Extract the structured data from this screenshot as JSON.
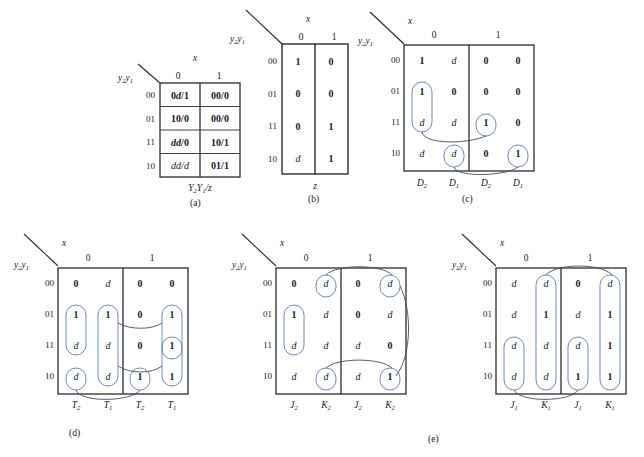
{
  "figure": {
    "captions": [
      "(a)",
      "(b)",
      "(c)",
      "(d)",
      "(e)"
    ]
  },
  "common": {
    "row_header": "y₂y₁",
    "col_var": "x",
    "col_values": [
      "0",
      "1"
    ],
    "row_values": [
      "00",
      "01",
      "11",
      "10"
    ],
    "dont_care": "d"
  },
  "table_a": {
    "caption": "(a)",
    "col_var": "x",
    "row_header": "y₂y₁",
    "col_values": [
      "0",
      "1"
    ],
    "row_values": [
      "00",
      "01",
      "11",
      "10"
    ],
    "bottom_label": "Y₂Y₁/z",
    "cells": [
      [
        "0d/1",
        "00/0"
      ],
      [
        "10/0",
        "00/0"
      ],
      [
        "dd/0",
        "10/1"
      ],
      [
        "dd/d",
        "01/1"
      ]
    ],
    "cell_styles": [
      [
        "mixed",
        "bold"
      ],
      [
        "bold",
        "bold"
      ],
      [
        "italic",
        "bold"
      ],
      [
        "italic",
        "bold"
      ]
    ]
  },
  "table_b": {
    "caption": "(b)",
    "col_var": "x",
    "row_header": "y₂y₁",
    "col_values": [
      "0",
      "1"
    ],
    "row_values": [
      "00",
      "01",
      "11",
      "10"
    ],
    "bottom_label": "z",
    "cells": [
      [
        "1",
        "0"
      ],
      [
        "0",
        "0"
      ],
      [
        "0",
        "1"
      ],
      [
        "d",
        "1"
      ]
    ]
  },
  "table_c": {
    "caption": "(c)",
    "col_var": "x",
    "row_header": "y₂y₁",
    "col_values": [
      "0",
      "1"
    ],
    "row_values": [
      "00",
      "01",
      "11",
      "10"
    ],
    "bottom_labels": [
      "D₂",
      "D₁",
      "D₂",
      "D₁"
    ],
    "cells": [
      [
        "1",
        "d",
        "0",
        "0"
      ],
      [
        "1",
        "0",
        "0",
        "0"
      ],
      [
        "d",
        "d",
        "1",
        "0"
      ],
      [
        "d",
        "d",
        "0",
        "1"
      ]
    ],
    "groups": [
      {
        "col": 0,
        "rows": [
          1,
          2
        ],
        "note": "D2 x=0 rows 01,11"
      },
      {
        "col": 2,
        "rows": [
          2,
          2
        ],
        "note": "D2 x=1 row 11"
      },
      {
        "col": 1,
        "rows": [
          3,
          3
        ],
        "note": "D1 x=0 row 10"
      },
      {
        "col": 3,
        "rows": [
          3,
          3
        ],
        "note": "D1 x=1 row 10"
      }
    ],
    "links": [
      {
        "from_col": 0,
        "from_row": 2,
        "to_col": 2,
        "to_row": 2
      },
      {
        "from_col": 1,
        "from_row": 3,
        "to_col": 3,
        "to_row": 3
      }
    ]
  },
  "table_d": {
    "caption": "(d)",
    "col_var": "x",
    "row_header": "y₂y₁",
    "col_values": [
      "0",
      "1"
    ],
    "row_values": [
      "00",
      "01",
      "11",
      "10"
    ],
    "bottom_labels": [
      "T₂",
      "T₁",
      "T₂",
      "T₁"
    ],
    "cells": [
      [
        "0",
        "d",
        "0",
        "0"
      ],
      [
        "1",
        "1",
        "0",
        "1"
      ],
      [
        "d",
        "d",
        "0",
        "1"
      ],
      [
        "d",
        "d",
        "1",
        "1"
      ]
    ],
    "groups": [
      {
        "col": 0,
        "rows": [
          1,
          2
        ]
      },
      {
        "col": 1,
        "rows": [
          1,
          3
        ]
      },
      {
        "col": 3,
        "rows": [
          1,
          3
        ]
      },
      {
        "col": 0,
        "rows": [
          3,
          3
        ]
      },
      {
        "col": 2,
        "rows": [
          3,
          3
        ]
      },
      {
        "col": 3,
        "rows": [
          2,
          2
        ]
      }
    ],
    "links": [
      {
        "from_col": 1,
        "from_row": 1,
        "to_col": 3,
        "to_row": 1
      },
      {
        "from_col": 1,
        "from_row": 3,
        "to_col": 3,
        "to_row": 3
      },
      {
        "from_col": 0,
        "from_row": 3,
        "to_col": 2,
        "to_row": 3
      }
    ]
  },
  "table_e1": {
    "caption": "(e)",
    "col_var": "x",
    "row_header": "y₂y₁",
    "col_values": [
      "0",
      "1"
    ],
    "row_values": [
      "00",
      "01",
      "11",
      "10"
    ],
    "bottom_labels": [
      "J₂",
      "K₂",
      "J₂",
      "K₂"
    ],
    "cells": [
      [
        "0",
        "d",
        "0",
        "d"
      ],
      [
        "1",
        "d",
        "0",
        "d"
      ],
      [
        "d",
        "d",
        "d",
        "0"
      ],
      [
        "d",
        "d",
        "d",
        "1"
      ]
    ],
    "groups": [
      {
        "col": 0,
        "rows": [
          1,
          2
        ]
      },
      {
        "col": 1,
        "rows": [
          0,
          0
        ]
      },
      {
        "col": 3,
        "rows": [
          0,
          0
        ]
      },
      {
        "col": 1,
        "rows": [
          3,
          3
        ]
      },
      {
        "col": 3,
        "rows": [
          3,
          3
        ]
      }
    ],
    "links": [
      {
        "from_col": 1,
        "from_row": 0,
        "to_col": 3,
        "to_row": 0
      },
      {
        "from_col": 1,
        "from_row": 3,
        "to_col": 3,
        "to_row": 3
      },
      {
        "from_col": 3,
        "from_row": 0,
        "to_col": 3,
        "to_row": 3
      }
    ]
  },
  "table_e2": {
    "caption": "",
    "col_var": "x",
    "row_header": "y₂y₁",
    "col_values": [
      "0",
      "1"
    ],
    "row_values": [
      "00",
      "01",
      "11",
      "10"
    ],
    "bottom_labels": [
      "J₁",
      "K₁",
      "J₁",
      "K₁"
    ],
    "cells": [
      [
        "d",
        "d",
        "0",
        "d"
      ],
      [
        "d",
        "1",
        "d",
        "1"
      ],
      [
        "d",
        "d",
        "d",
        "1"
      ],
      [
        "d",
        "d",
        "1",
        "1"
      ]
    ],
    "groups": [
      {
        "col": 1,
        "rows": [
          0,
          3
        ]
      },
      {
        "col": 3,
        "rows": [
          0,
          3
        ]
      },
      {
        "col": 0,
        "rows": [
          2,
          3
        ]
      },
      {
        "col": 2,
        "rows": [
          2,
          3
        ]
      }
    ],
    "links": [
      {
        "from_col": 1,
        "from_row": 0,
        "to_col": 3,
        "to_row": 0
      },
      {
        "from_col": 0,
        "from_row": 3,
        "to_col": 2,
        "to_row": 3
      }
    ]
  },
  "colors": {
    "grid": "#2b2b2b",
    "oval": "#5b7fb5",
    "arc": "#4a4a5a",
    "text": "#1a1a1a",
    "background": "#ffffff"
  }
}
